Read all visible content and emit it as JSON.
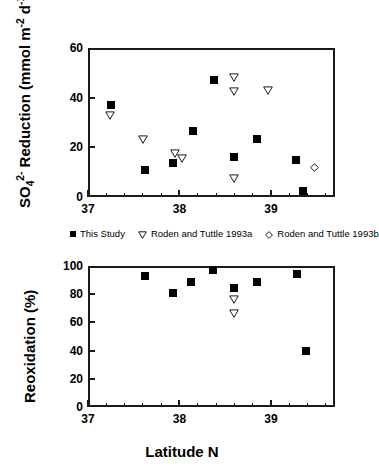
{
  "figure": {
    "xlabel": "Latitude N"
  },
  "legend": {
    "position": "between-panels",
    "entries": [
      {
        "label": "This Study",
        "symbol": "filled-square",
        "color": "#000000"
      },
      {
        "label": "Roden and Tuttle 1993a",
        "symbol": "open-triangle-down",
        "color": "#000000"
      },
      {
        "label": "Roden and Tuttle 1993b",
        "symbol": "open-diamond",
        "color": "#000000"
      }
    ]
  },
  "chart_data": [
    {
      "type": "scatter",
      "panel": "top",
      "title": "",
      "xlabel": "Latitude N",
      "ylabel": "SO4 2- Reduction (mmol m-2 d-1)",
      "ylabel_parts": {
        "pre": "SO",
        "sub1": "4",
        "sup1": "2-",
        "mid": " Reduction (mmol m",
        "sup2": "-2",
        "mid2": " d",
        "sup3": "-1",
        "post": ")"
      },
      "xlim": [
        37,
        39.7
      ],
      "ylim": [
        0,
        60
      ],
      "xticks": [
        37,
        38,
        39
      ],
      "xtick_labels": [
        "37",
        "38",
        "39"
      ],
      "xminor_step": 0.2,
      "yticks": [
        0,
        20,
        40,
        60
      ],
      "ytick_labels": [
        "0",
        "20",
        "40",
        "60"
      ],
      "grid": false,
      "series": [
        {
          "name": "This Study",
          "marker": "filled-square",
          "points": [
            {
              "x": 37.25,
              "y": 37.0
            },
            {
              "x": 37.62,
              "y": 11.0
            },
            {
              "x": 37.93,
              "y": 13.5
            },
            {
              "x": 38.15,
              "y": 26.5
            },
            {
              "x": 38.38,
              "y": 47.0
            },
            {
              "x": 38.6,
              "y": 16.0
            },
            {
              "x": 38.85,
              "y": 23.5
            },
            {
              "x": 39.27,
              "y": 15.0
            },
            {
              "x": 39.35,
              "y": 2.5
            }
          ]
        },
        {
          "name": "Roden and Tuttle 1993a",
          "marker": "open-triangle-down",
          "points": [
            {
              "x": 37.24,
              "y": 35.0
            },
            {
              "x": 37.6,
              "y": 25.0
            },
            {
              "x": 37.95,
              "y": 19.5
            },
            {
              "x": 38.03,
              "y": 17.5
            },
            {
              "x": 38.6,
              "y": 50.0
            },
            {
              "x": 38.6,
              "y": 44.5
            },
            {
              "x": 38.6,
              "y": 9.5
            },
            {
              "x": 38.97,
              "y": 45.0
            }
          ]
        },
        {
          "name": "Roden and Tuttle 1993b",
          "marker": "open-diamond",
          "points": [
            {
              "x": 39.48,
              "y": 14.0
            }
          ]
        }
      ]
    },
    {
      "type": "scatter",
      "panel": "bottom",
      "title": "",
      "xlabel": "Latitude N",
      "ylabel": "Reoxidation (%)",
      "xlim": [
        37,
        39.7
      ],
      "ylim": [
        0,
        100
      ],
      "xticks": [
        37,
        38,
        39
      ],
      "xtick_labels": [
        "37",
        "38",
        "39"
      ],
      "xminor_step": 0.2,
      "yticks": [
        0,
        20,
        40,
        60,
        80,
        100
      ],
      "ytick_labels": [
        "0",
        "20",
        "40",
        "60",
        "80",
        "100"
      ],
      "grid": false,
      "series": [
        {
          "name": "This Study",
          "marker": "filled-square",
          "points": [
            {
              "x": 37.62,
              "y": 93.0
            },
            {
              "x": 37.93,
              "y": 81.0
            },
            {
              "x": 38.13,
              "y": 89.0
            },
            {
              "x": 38.37,
              "y": 97.5
            },
            {
              "x": 38.6,
              "y": 84.5
            },
            {
              "x": 38.85,
              "y": 88.5
            },
            {
              "x": 39.28,
              "y": 94.5
            },
            {
              "x": 39.38,
              "y": 40.0
            }
          ]
        },
        {
          "name": "Roden and Tuttle 1993a",
          "marker": "open-triangle-down",
          "points": [
            {
              "x": 38.6,
              "y": 80.0
            },
            {
              "x": 38.6,
              "y": 70.0
            }
          ]
        }
      ]
    }
  ]
}
